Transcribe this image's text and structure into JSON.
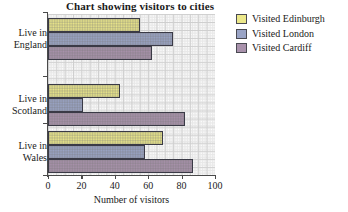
{
  "chart_data": {
    "type": "bar",
    "orientation": "horizontal",
    "title": "Chart showing visitors to cities",
    "xlabel": "Number of visitors",
    "ylabel": "",
    "xlim": [
      0,
      100
    ],
    "xticks": [
      "0",
      "20",
      "40",
      "60",
      "80",
      "100"
    ],
    "grid": true,
    "legend_position": "right",
    "categories": [
      "Live in England",
      "Live in Scotland",
      "Live in Wales"
    ],
    "category_lines": [
      [
        "Live in",
        "England"
      ],
      [
        "Live in",
        "Scotland"
      ],
      [
        "Live in",
        "Wales"
      ]
    ],
    "series": [
      {
        "name": "Visited Edinburgh",
        "color": "#ece88a",
        "values": [
          55,
          43,
          69
        ]
      },
      {
        "name": "Visited London",
        "color": "#9aa4c6",
        "values": [
          75,
          21,
          58
        ]
      },
      {
        "name": "Visited Cardiff",
        "color": "#a992ac",
        "values": [
          62,
          82,
          87
        ]
      }
    ]
  },
  "legend": {
    "items": [
      {
        "label": "Visited Edinburgh",
        "swatch": "#ece88a"
      },
      {
        "label": "Visited London",
        "swatch": "#9aa4c6"
      },
      {
        "label": "Visited Cardiff",
        "swatch": "#a992ac"
      }
    ]
  },
  "axis": {
    "x_title": "Number of visitors",
    "tick_labels": [
      "0",
      "20",
      "40",
      "60",
      "80",
      "100"
    ]
  },
  "colors": {
    "edinburgh": "#ece88a",
    "london": "#9aa4c6",
    "cardiff": "#a992ac",
    "bar_outline": "#3a3a46",
    "axis": "#4a4a4a",
    "grid_major": "#cfcfcf",
    "grid_minor": "#e8e8e8",
    "background": "#ffffff"
  }
}
